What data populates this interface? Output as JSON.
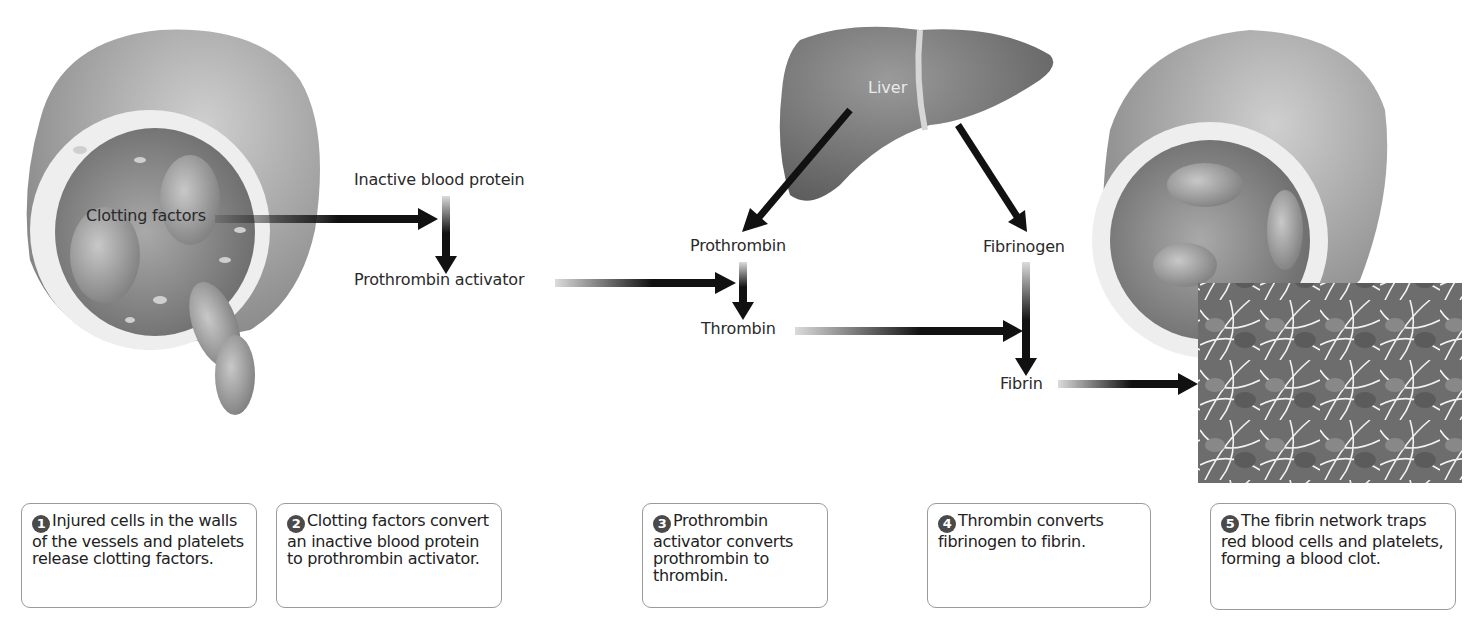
{
  "diagram": {
    "labels": {
      "clotting_factors": "Clotting factors",
      "inactive_blood_protein": "Inactive blood protein",
      "prothrombin_activator": "Prothrombin activator",
      "liver": "Liver",
      "prothrombin": "Prothrombin",
      "fibrinogen": "Fibrinogen",
      "thrombin": "Thrombin",
      "fibrin": "Fibrin"
    },
    "steps": [
      {
        "number": "1",
        "text": "Injured cells in the walls of the vessels and platelets release clotting factors."
      },
      {
        "number": "2",
        "text": "Clotting factors convert an inactive blood protein to prothrombin activator."
      },
      {
        "number": "3",
        "text": "Prothrombin activator converts prothrombin to thrombin."
      },
      {
        "number": "4",
        "text": "Thrombin converts fibrinogen to fibrin."
      },
      {
        "number": "5",
        "text": "The fibrin network traps red blood cells and platelets, forming a blood clot."
      }
    ],
    "flow": [
      {
        "from": "Clotting factors",
        "to": "Inactive blood protein → Prothrombin activator"
      },
      {
        "from": "Inactive blood protein",
        "to": "Prothrombin activator"
      },
      {
        "from": "Prothrombin activator",
        "to": "Prothrombin → Thrombin"
      },
      {
        "from": "Liver",
        "to": "Prothrombin"
      },
      {
        "from": "Liver",
        "to": "Fibrinogen"
      },
      {
        "from": "Prothrombin",
        "to": "Thrombin"
      },
      {
        "from": "Thrombin",
        "to": "Fibrinogen → Fibrin"
      },
      {
        "from": "Fibrinogen",
        "to": "Fibrin"
      },
      {
        "from": "Fibrin",
        "to": "Fibrin network (blood clot)"
      }
    ],
    "colors": {
      "arrow": "#111111",
      "liver": "#6e6e6e",
      "vessel": "#8a8a8a",
      "card_border": "#9a9a9a",
      "number_badge": "#4a4a4a"
    }
  }
}
